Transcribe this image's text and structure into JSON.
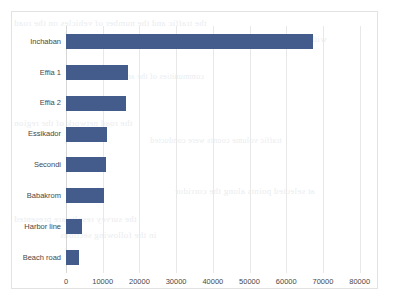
{
  "chart_data": {
    "type": "bar",
    "orientation": "horizontal",
    "title": "",
    "subtitle": "",
    "xlabel": "",
    "ylabel": "",
    "categories": [
      "Inchaban",
      "Effia 1",
      "Effia 2",
      "Essikador",
      "Secondi",
      "Babakrom",
      "Harbor line",
      "Beach road"
    ],
    "values": [
      67300,
      16900,
      16400,
      11200,
      10900,
      10400,
      4400,
      3600
    ],
    "series": [
      {
        "name": "",
        "values": [
          67300,
          16900,
          16400,
          11200,
          10900,
          10400,
          4400,
          3600
        ]
      }
    ],
    "xlim": [
      0,
      85000
    ],
    "xticks": [
      0,
      10000,
      20000,
      30000,
      40000,
      50000,
      60000,
      70000,
      80000
    ],
    "xtick_labels": [
      "0",
      "10000",
      "20000",
      "30000",
      "40000",
      "50000",
      "60000",
      "70000",
      "80000"
    ],
    "grid": true,
    "grid_axis": "x",
    "legend": false,
    "legend_position": "none",
    "bar_color": "#445C8B",
    "grid_color": "#e8e8e8",
    "border_color": "#e2e2e2",
    "plot_background": "#ffffff",
    "label_color": "#484848",
    "annotations": []
  },
  "background_bleed": {
    "description": "faint mirrored show-through text from the reverse side of the scanned page",
    "lines": [
      "the traffic and the number of vehicles on the road",
      "within the study area and the adjoining",
      "communities of the area",
      "the road network of the region",
      "traffic volume counts were conducted",
      "at selected points along the corridor",
      "the survey results are presented",
      "in the following sections"
    ]
  }
}
